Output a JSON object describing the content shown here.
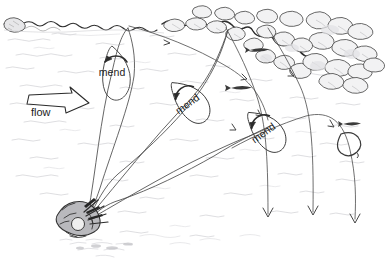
{
  "illustration": {
    "title": "Fly fishing mend diagram",
    "medium": "pen-and-ink line drawing",
    "background_color": "#ffffff",
    "ink_color": "#2b2b2b",
    "water_texture_color": "#c9c9cd",
    "rock_outline_color": "#3a3a3a"
  },
  "labels": {
    "flow": "flow",
    "mend_1": "mend",
    "mend_2": "mend",
    "mend_3": "mend"
  },
  "annotations": [
    {
      "name": "flow-arrow",
      "label": "flow",
      "x": 30,
      "y": 95,
      "direction": "right-down",
      "style": "hollow-outline-arrow"
    },
    {
      "name": "mend-loop-1",
      "label": "mend",
      "x": 112,
      "y": 72,
      "rotation": 0,
      "style": "upstream-curl-arrow"
    },
    {
      "name": "mend-loop-2",
      "label": "mend",
      "x": 186,
      "y": 102,
      "rotation": -38,
      "style": "upstream-curl-arrow"
    },
    {
      "name": "mend-loop-3",
      "label": "mend",
      "x": 262,
      "y": 131,
      "rotation": -38,
      "style": "upstream-curl-arrow"
    }
  ],
  "scene_elements": {
    "angler": {
      "name": "angler-figure",
      "x": 78,
      "y": 218,
      "description": "shaded angler casting from lower-left bank"
    },
    "far_bank": {
      "name": "far-bank-shoreline",
      "description": "wavy shoreline across the top of the frame"
    },
    "rocky_bank": {
      "name": "rocky-cobble-bank",
      "description": "cluster of cobbles and boulders at the upper right"
    },
    "fish": [
      {
        "name": "fish-silhouette",
        "x": 258,
        "y": 50
      },
      {
        "name": "fish-silhouette",
        "x": 240,
        "y": 88
      },
      {
        "name": "fish-silhouette",
        "x": 351,
        "y": 124
      }
    ],
    "rise_ring": {
      "name": "rise-ring",
      "x": 350,
      "y": 145
    },
    "drift_arrows": [
      {
        "name": "drift-arrow-down",
        "x": 268,
        "y": 215
      },
      {
        "name": "drift-arrow-down",
        "x": 313,
        "y": 212
      },
      {
        "name": "drift-arrow-down",
        "x": 355,
        "y": 220
      }
    ],
    "fly_lines": {
      "name": "fly-line-set",
      "count": 3,
      "description": "three fly lines fanning from the angler to the far bank"
    }
  }
}
